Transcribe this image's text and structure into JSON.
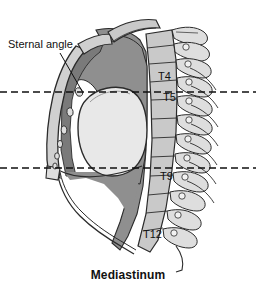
{
  "figure": {
    "caption": "Mediastinum",
    "callouts": [
      {
        "id": "sternal-angle",
        "label": "Sternal angle",
        "text_x": 8,
        "text_y": 48,
        "leader": {
          "x1": 60,
          "y1": 53,
          "x2": 82,
          "y2": 91
        }
      }
    ],
    "vertebra_labels": [
      {
        "id": "T4",
        "label": "T4",
        "x": 158,
        "y": 80
      },
      {
        "id": "T5",
        "label": "T5",
        "x": 163,
        "y": 101
      },
      {
        "id": "T9",
        "label": "T9",
        "x": 160,
        "y": 180
      },
      {
        "id": "T12",
        "label": "T12",
        "x": 143,
        "y": 238
      }
    ],
    "reference_planes": [
      {
        "id": "sternal-angle-plane",
        "label": "",
        "y": 92,
        "x1": 0,
        "x2": 256
      },
      {
        "id": "lower-plane",
        "label": "",
        "y": 168,
        "x1": 0,
        "x2": 256
      }
    ],
    "colors": {
      "background": "#ffffff",
      "ink": "#111111",
      "outline": "#2b2b2b",
      "mediastinum_fill": "#8f8f8f",
      "mediastinum_dark": "#7a7a7a",
      "heart_fill": "#e8e8e8",
      "bone_fill": "#c9c9c9",
      "bone_light": "#dedede",
      "bone_shadow": "#a8a8a8",
      "sternum_fill": "#d0d0d0",
      "lung_field": "#ffffff"
    },
    "structures": [
      {
        "id": "sternum",
        "name": "Sternum"
      },
      {
        "id": "manubrium",
        "name": "Manubrium"
      },
      {
        "id": "vertebral-column",
        "name": "Thoracic vertebral column"
      },
      {
        "id": "mediastinum-region",
        "name": "Mediastinum"
      },
      {
        "id": "pericardium-heart",
        "name": "Heart / pericardial sac"
      },
      {
        "id": "diaphragm",
        "name": "Diaphragm"
      },
      {
        "id": "first-rib",
        "name": "First rib"
      },
      {
        "id": "costal-cartilages",
        "name": "Costal cartilages"
      }
    ]
  }
}
